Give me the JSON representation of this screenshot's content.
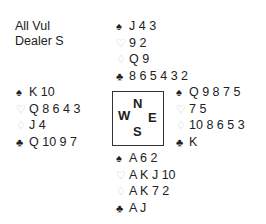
{
  "info": {
    "vulnerability": "All Vul",
    "dealer": "Dealer S"
  },
  "suits": {
    "spades": "♠",
    "hearts": "♡",
    "diamonds": "♢",
    "clubs": "♣"
  },
  "hands": {
    "north": {
      "spades": "J 4 3",
      "hearts": "9 2",
      "diamonds": "Q 9",
      "clubs": "8 6 5 4 3 2"
    },
    "west": {
      "spades": "K 10",
      "hearts": "Q 8 6 4 3",
      "diamonds": "J 4",
      "clubs": "Q 10 9 7"
    },
    "east": {
      "spades": "Q 9 8 7 5",
      "hearts": "7 5",
      "diamonds": "10 8 6 5 3",
      "clubs": "K"
    },
    "south": {
      "spades": "A 6 2",
      "hearts": "A K J 10",
      "diamonds": "A K 7 2",
      "clubs": "A J"
    }
  },
  "compass": {
    "n": "N",
    "w": "W",
    "e": "E",
    "s": "S"
  }
}
